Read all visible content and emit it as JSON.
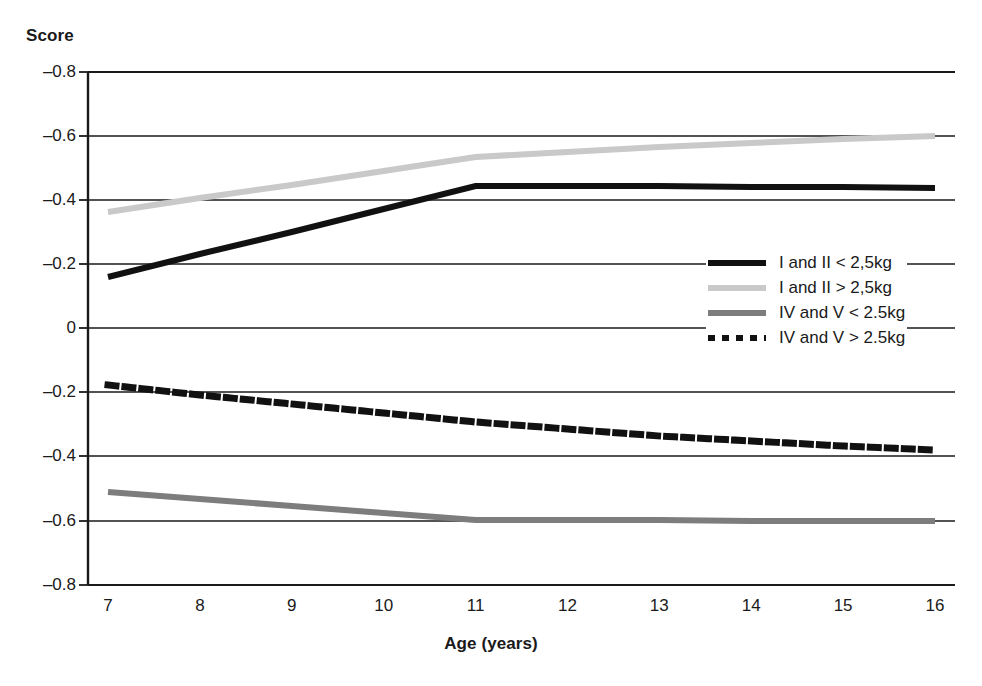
{
  "chart_data": {
    "type": "line",
    "title": "",
    "xlabel": "Age (years)",
    "ylabel": "Score",
    "x": [
      7,
      8,
      9,
      10,
      11,
      12,
      13,
      14,
      15,
      16
    ],
    "x_tick_labels": [
      "7",
      "8",
      "9",
      "10",
      "11",
      "12",
      "13",
      "14",
      "15",
      "16"
    ],
    "y_tick_labels": [
      "–0.8",
      "–0.6",
      "–0.4",
      "–0.2",
      "0",
      "–0.2",
      "–0.4",
      "–0.6",
      "–0.8"
    ],
    "y_tick_positions": [
      72,
      136,
      200,
      264,
      328,
      392,
      456,
      521,
      585
    ],
    "xlim": [
      7,
      16
    ],
    "grid": "horizontal",
    "legend_position": "center-right",
    "series": [
      {
        "name": "I and II < 2,5kg",
        "style": "solid",
        "color": "#111111",
        "width": 6,
        "values": [
          -0.17,
          -0.237,
          -0.305,
          -0.372,
          -0.44,
          -0.439,
          -0.438,
          -0.437,
          -0.436,
          -0.435
        ],
        "pixel_y": [
          277,
          254,
          232,
          209,
          186,
          186,
          186,
          187,
          187,
          188
        ]
      },
      {
        "name": "I and II > 2,5kg",
        "style": "solid",
        "color": "#c9c9c9",
        "width": 6,
        "values": [
          -0.435,
          -0.471,
          -0.508,
          -0.544,
          -0.58,
          -0.596,
          -0.612,
          -0.625,
          -0.635,
          -0.645
        ],
        "pixel_y": [
          212,
          198,
          185,
          171,
          157,
          152,
          147,
          143,
          139,
          136
        ]
      },
      {
        "name": "IV and V < 2.5kg",
        "style": "solid",
        "color": "#7d7d7d",
        "width": 6,
        "values": [
          -0.5,
          -0.521,
          -0.542,
          -0.564,
          -0.585,
          -0.585,
          -0.585,
          -0.584,
          -0.584,
          -0.583
        ],
        "pixel_y": [
          492,
          499,
          506,
          513,
          520,
          520,
          520,
          521,
          521,
          521
        ]
      },
      {
        "name": "IV and V > 2.5kg",
        "style": "dotted",
        "color": "#111111",
        "width": 7,
        "values": [
          -0.18,
          -0.21,
          -0.24,
          -0.268,
          -0.296,
          -0.318,
          -0.338,
          -0.353,
          -0.366,
          -0.375
        ],
        "pixel_y": [
          385,
          395,
          404,
          413,
          422,
          429,
          436,
          441,
          446,
          450
        ]
      }
    ]
  },
  "legend": {
    "items": [
      {
        "label": "I and II < 2,5kg",
        "swatch": "solid-black"
      },
      {
        "label": "I and II > 2,5kg",
        "swatch": "solid-lightgray"
      },
      {
        "label": "IV and V < 2.5kg",
        "swatch": "solid-midgray"
      },
      {
        "label": "IV and V > 2.5kg",
        "swatch": "dotted-black"
      }
    ]
  },
  "axes": {
    "plot_left": 88,
    "plot_right": 955,
    "plot_top": 72,
    "plot_bottom": 585,
    "line_x_start": 108,
    "line_x_end": 935,
    "axis_color": "#1a1a1a"
  }
}
